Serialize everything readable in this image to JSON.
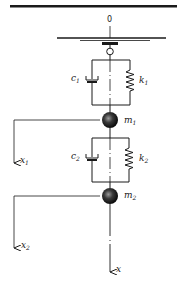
{
  "diagram": {
    "type": "two-degree-of-freedom spring-mass-damper system",
    "origin_label": "0",
    "axis_label": "x",
    "stages": [
      {
        "damper_label": "c",
        "damper_sub": "1",
        "spring_label": "k",
        "spring_sub": "1",
        "mass_label": "m",
        "mass_sub": "1",
        "disp_label": "x",
        "disp_sub": "1"
      },
      {
        "damper_label": "c",
        "damper_sub": "2",
        "spring_label": "k",
        "spring_sub": "2",
        "mass_label": "m",
        "mass_sub": "2",
        "disp_label": "x",
        "disp_sub": "2"
      }
    ],
    "colors": {
      "line": "#1a1a1a",
      "mass": "#2a2a2a",
      "background": "#ffffff"
    }
  }
}
